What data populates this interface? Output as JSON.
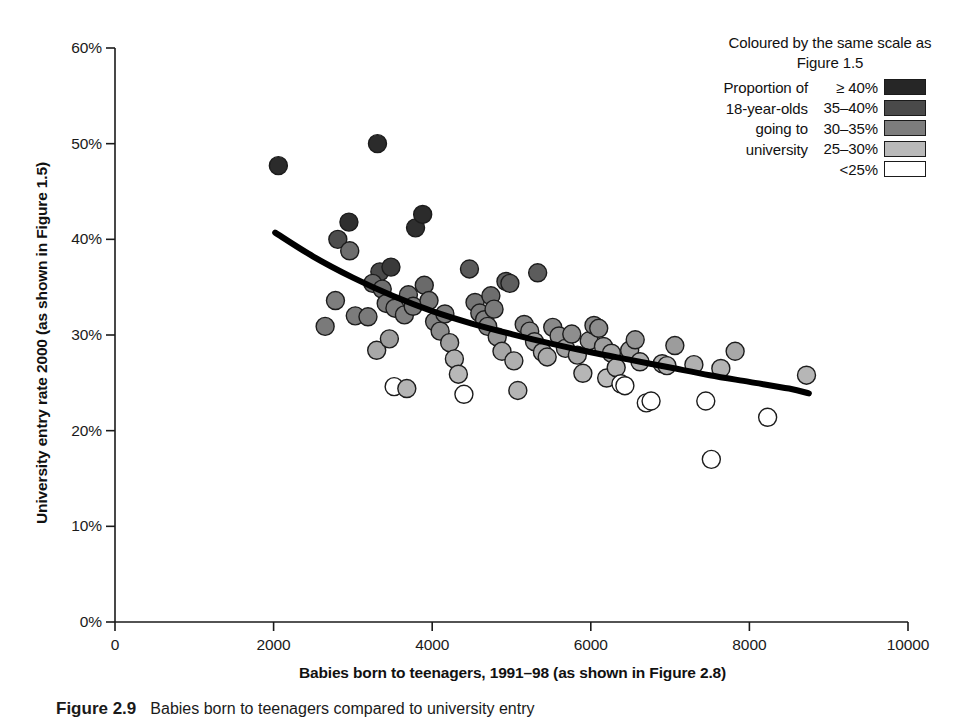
{
  "chart_data": {
    "type": "scatter",
    "title": "",
    "xlabel": "Babies born to teenagers, 1991–98 (as shown in Figure 2.8)",
    "ylabel": "University entry rate 2000 (as shown in Figure 1.5)",
    "xlim": [
      0,
      10000
    ],
    "ylim": [
      0,
      60
    ],
    "xticks": [
      0,
      2000,
      4000,
      6000,
      8000,
      10000
    ],
    "xticklabels": [
      "0",
      "2000",
      "4000",
      "6000",
      "8000",
      "10000"
    ],
    "yticks": [
      0,
      10,
      20,
      30,
      40,
      50,
      60
    ],
    "yticklabels": [
      "0%",
      "10%",
      "20%",
      "30%",
      "40%",
      "50%",
      "60%"
    ],
    "grid": false,
    "legend_position": "top-right",
    "marker_diameter_px": 18,
    "series": [
      {
        "name": "Local authorities",
        "points": [
          [
            2060,
            47.7,
            "#2b2b2b"
          ],
          [
            3310,
            50.0,
            "#2b2b2b"
          ],
          [
            2810,
            40.0,
            "#4d4d4d"
          ],
          [
            2950,
            41.8,
            "#2f2f2f"
          ],
          [
            3790,
            41.2,
            "#2f2f2f"
          ],
          [
            3880,
            42.6,
            "#2b2b2b"
          ],
          [
            2960,
            38.8,
            "#6e6e6e"
          ],
          [
            3340,
            36.6,
            "#4a4a4a"
          ],
          [
            3480,
            37.1,
            "#3a3a3a"
          ],
          [
            2650,
            30.9,
            "#7a7a7a"
          ],
          [
            2780,
            33.6,
            "#7e7e7e"
          ],
          [
            3030,
            32.0,
            "#7c7c7c"
          ],
          [
            3190,
            31.9,
            "#7a7a7a"
          ],
          [
            3250,
            35.4,
            "#6a6a6a"
          ],
          [
            3370,
            34.8,
            "#6e6e6e"
          ],
          [
            3420,
            33.3,
            "#7a7a7a"
          ],
          [
            3530,
            32.8,
            "#7c7c7c"
          ],
          [
            3650,
            32.1,
            "#808080"
          ],
          [
            3700,
            34.2,
            "#737373"
          ],
          [
            3760,
            33.0,
            "#7a7a7a"
          ],
          [
            3300,
            28.4,
            "#a8a8a8"
          ],
          [
            3460,
            29.6,
            "#9c9c9c"
          ],
          [
            3520,
            24.6,
            "#ffffff"
          ],
          [
            3680,
            24.4,
            "#b4b4b4"
          ],
          [
            3900,
            35.2,
            "#6a6a6a"
          ],
          [
            3960,
            33.6,
            "#787878"
          ],
          [
            4030,
            31.4,
            "#828282"
          ],
          [
            4100,
            30.4,
            "#8c8c8c"
          ],
          [
            4160,
            32.2,
            "#7e7e7e"
          ],
          [
            4220,
            29.2,
            "#a0a0a0"
          ],
          [
            4280,
            27.5,
            "#b0b0b0"
          ],
          [
            4330,
            25.9,
            "#b8b8b8"
          ],
          [
            4400,
            23.8,
            "#ffffff"
          ],
          [
            4470,
            36.9,
            "#5a5a5a"
          ],
          [
            4540,
            33.4,
            "#767676"
          ],
          [
            4600,
            32.3,
            "#7c7c7c"
          ],
          [
            4660,
            31.6,
            "#808080"
          ],
          [
            4700,
            30.9,
            "#868686"
          ],
          [
            4740,
            34.1,
            "#6e6e6e"
          ],
          [
            4780,
            32.7,
            "#7a7a7a"
          ],
          [
            4820,
            29.8,
            "#989898"
          ],
          [
            4880,
            28.3,
            "#a6a6a6"
          ],
          [
            4930,
            35.6,
            "#606060"
          ],
          [
            4980,
            35.4,
            "#5e5e5e"
          ],
          [
            5030,
            27.3,
            "#b0b0b0"
          ],
          [
            5080,
            24.2,
            "#b4b4b4"
          ],
          [
            5160,
            31.1,
            "#868686"
          ],
          [
            5230,
            30.4,
            "#8e8e8e"
          ],
          [
            5290,
            29.3,
            "#9a9a9a"
          ],
          [
            5330,
            36.5,
            "#5c5c5c"
          ],
          [
            5390,
            28.2,
            "#a6a6a6"
          ],
          [
            5450,
            27.7,
            "#ababab"
          ],
          [
            5520,
            30.8,
            "#8a8a8a"
          ],
          [
            5600,
            29.9,
            "#929292"
          ],
          [
            5680,
            28.6,
            "#a0a0a0"
          ],
          [
            5760,
            30.1,
            "#8e8e8e"
          ],
          [
            5830,
            27.9,
            "#a8a8a8"
          ],
          [
            5900,
            26.0,
            "#b6b6b6"
          ],
          [
            5980,
            29.4,
            "#989898"
          ],
          [
            6040,
            31.0,
            "#888888"
          ],
          [
            6100,
            30.7,
            "#8c8c8c"
          ],
          [
            6160,
            28.8,
            "#9e9e9e"
          ],
          [
            6200,
            25.5,
            "#bcbcbc"
          ],
          [
            6260,
            28.1,
            "#a4a4a4"
          ],
          [
            6320,
            26.6,
            "#b2b2b2"
          ],
          [
            6380,
            24.9,
            "#ffffff"
          ],
          [
            6430,
            24.7,
            "#ffffff"
          ],
          [
            6490,
            28.4,
            "#a0a0a0"
          ],
          [
            6560,
            29.5,
            "#969696"
          ],
          [
            6620,
            27.2,
            "#aeaeae"
          ],
          [
            6700,
            22.9,
            "#ffffff"
          ],
          [
            6760,
            23.1,
            "#ffffff"
          ],
          [
            6900,
            27.0,
            "#b0b0b0"
          ],
          [
            6960,
            26.8,
            "#b2b2b2"
          ],
          [
            7060,
            28.9,
            "#9c9c9c"
          ],
          [
            7300,
            26.9,
            "#b0b0b0"
          ],
          [
            7450,
            23.1,
            "#ffffff"
          ],
          [
            7520,
            17.0,
            "#ffffff"
          ],
          [
            7640,
            26.5,
            "#b4b4b4"
          ],
          [
            7820,
            28.3,
            "#a8a8a8"
          ],
          [
            8230,
            21.4,
            "#ffffff"
          ],
          [
            8720,
            25.8,
            "#b6b6b6"
          ]
        ]
      }
    ],
    "trend_line": {
      "name": "fitted curve",
      "color": "#000000",
      "width_px": 6,
      "points": [
        [
          2020,
          40.7
        ],
        [
          2500,
          38.2
        ],
        [
          3000,
          36.0
        ],
        [
          3500,
          34.1
        ],
        [
          4000,
          32.5
        ],
        [
          4500,
          31.2
        ],
        [
          5000,
          30.1
        ],
        [
          5500,
          29.1
        ],
        [
          6000,
          28.2
        ],
        [
          6500,
          27.4
        ],
        [
          7000,
          26.6
        ],
        [
          7500,
          25.8
        ],
        [
          8000,
          25.1
        ],
        [
          8500,
          24.4
        ],
        [
          8750,
          23.9
        ]
      ]
    }
  },
  "legend": {
    "heading": "Coloured by the same scale as Figure 1.5",
    "caption": "Proportion of 18-year-olds going to university",
    "items": [
      {
        "label": "≥ 40%",
        "color": "#262626"
      },
      {
        "label": "35–40%",
        "color": "#4a4a4a"
      },
      {
        "label": "30–35%",
        "color": "#7d7d7d"
      },
      {
        "label": "25–30%",
        "color": "#b9b9b9"
      },
      {
        "label": "<25%",
        "color": "#ffffff"
      }
    ]
  },
  "figure_caption": {
    "number": "Figure 2.9",
    "text": "Babies born to teenagers compared to university entry"
  }
}
